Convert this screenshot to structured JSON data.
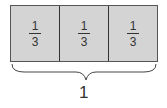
{
  "diagram": {
    "type": "fraction-bar",
    "parts": [
      {
        "numerator": "1",
        "denominator": "3"
      },
      {
        "numerator": "1",
        "denominator": "3"
      },
      {
        "numerator": "1",
        "denominator": "3"
      }
    ],
    "total_label": "1",
    "colors": {
      "fill": "#d4d4d4",
      "stroke": "#333333"
    }
  }
}
